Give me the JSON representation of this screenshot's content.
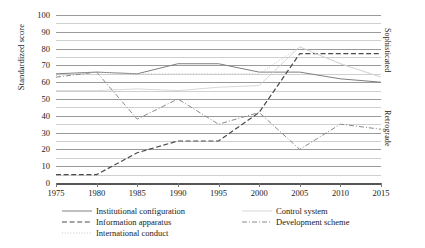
{
  "chart_data": {
    "type": "line",
    "title": "",
    "xlabel": "",
    "ylabel": "Standardized score",
    "xlim": [
      1975,
      2015
    ],
    "ylim": [
      0,
      100
    ],
    "grid": true,
    "grid_major_step": 10,
    "grid_minor_step": 5,
    "legend_position": "bottom",
    "x_tick_labels": [
      "1975",
      "1980",
      "1985",
      "1990",
      "1995",
      "2000",
      "2005",
      "2010",
      "2015"
    ],
    "y_tick_labels": [
      "0",
      "10",
      "20",
      "30",
      "40",
      "50",
      "60",
      "70",
      "80",
      "90",
      "100"
    ],
    "right_axis_labels": {
      "upper": "Sophisticated",
      "lower": "Retrograde"
    },
    "x": [
      1975,
      1980,
      1985,
      1990,
      1995,
      2000,
      2005,
      2010,
      2015
    ],
    "series": [
      {
        "name": "Institutional configuration",
        "style": "solid",
        "color": "#808080",
        "values": [
          65,
          66,
          65,
          71,
          71,
          66,
          66,
          62,
          60
        ]
      },
      {
        "name": "Information apparatus",
        "style": "dashed",
        "color": "#4a4a4a",
        "values": [
          5,
          5,
          18,
          25,
          25,
          42,
          77,
          77,
          77
        ]
      },
      {
        "name": "International conduct",
        "style": "dotted",
        "color": "#c0c0c0",
        "values": [
          64,
          66,
          65,
          65,
          65,
          65,
          81,
          71,
          63
        ]
      },
      {
        "name": "Control system",
        "style": "solid-light",
        "color": "#d2d2d2",
        "values": [
          55,
          55,
          56,
          55,
          57,
          58,
          81,
          71,
          63
        ]
      },
      {
        "name": "Development scheme",
        "style": "dashdot",
        "color": "#8a8a8a",
        "values": [
          63,
          66,
          38,
          50,
          35,
          42,
          20,
          35,
          32
        ]
      }
    ]
  },
  "legend": {
    "entries": [
      {
        "label": "Institutional configuration",
        "style": "solid"
      },
      {
        "label": "Information apparatus",
        "style": "dashed"
      },
      {
        "label": "International conduct",
        "style": "dotted"
      },
      {
        "label": "Control system",
        "style": "solid-light"
      },
      {
        "label": "Development scheme",
        "style": "dashdot"
      }
    ]
  },
  "axis": {
    "y_title": "Standardized score",
    "right_upper": "Sophisticated",
    "right_lower": "Retrograde"
  }
}
